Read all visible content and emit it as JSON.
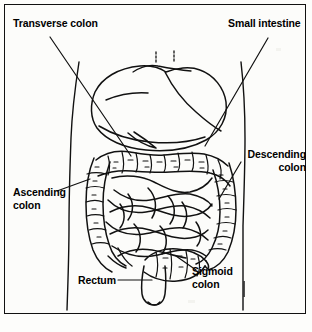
{
  "figure": {
    "type": "anatomical-line-drawing",
    "style": "black and white scanned line art",
    "border_color": "#111111",
    "background_color": "#fcfcfa",
    "ink_color": "#000000"
  },
  "labels": {
    "transverse_colon": "Transverse colon",
    "small_intestine": "Small intestine",
    "descending_colon": "Descending\ncolon",
    "ascending_colon": "Ascending\ncolon",
    "rectum": "Rectum",
    "sigmoid_colon": "Sigmoid\ncolon"
  },
  "leaders": [
    {
      "name": "transverse-colon-leader",
      "from": [
        50,
        37
      ],
      "to": [
        131,
        156
      ]
    },
    {
      "name": "small-intestine-leader",
      "from": [
        268,
        38
      ],
      "to": [
        205,
        146
      ]
    },
    {
      "name": "descending-colon-leader",
      "from": [
        241,
        162
      ],
      "to": [
        219,
        199
      ]
    },
    {
      "name": "ascending-colon-leader",
      "from": [
        57,
        191
      ],
      "to": [
        90,
        179
      ]
    },
    {
      "name": "rectum-leader",
      "from": [
        118,
        280
      ],
      "to": [
        152,
        280
      ]
    },
    {
      "name": "sigmoid-colon-leader",
      "from": [
        196,
        270
      ],
      "to": [
        176,
        256
      ]
    }
  ],
  "structures": [
    "liver",
    "transverse colon",
    "ascending colon",
    "descending colon",
    "small intestine coils",
    "sigmoid colon",
    "rectum",
    "abdominal body outline"
  ]
}
